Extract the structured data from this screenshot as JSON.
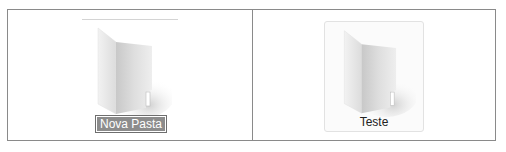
{
  "folders": [
    {
      "name": "Nova Pasta",
      "state": "renaming",
      "icon": "folder-icon"
    },
    {
      "name": "Teste",
      "state": "hover",
      "icon": "folder-icon"
    }
  ],
  "colors": {
    "border": "#8a8a8a",
    "selection_bg": "#8c8c8c",
    "selection_text": "#ffffff",
    "hover_border": "#e2e2e2"
  }
}
